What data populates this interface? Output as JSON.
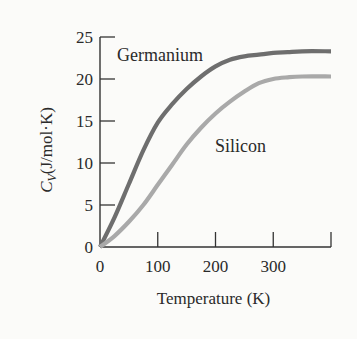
{
  "chart_data": {
    "type": "line",
    "title": "",
    "xlabel": "Temperature (K)",
    "ylabel": "C_V (J/mol·K)",
    "ylabel_main": "C",
    "ylabel_sub": "V",
    "ylabel_rest": "(J/mol·K)",
    "xlim": [
      0,
      400
    ],
    "ylim": [
      0,
      25
    ],
    "xticks": [
      0,
      100,
      200,
      300,
      400
    ],
    "xtick_labels": [
      "0",
      "100",
      "200",
      "300",
      ""
    ],
    "yticks": [
      0,
      5,
      10,
      15,
      20,
      25
    ],
    "ytick_labels": [
      "0",
      "5",
      "10",
      "15",
      "20",
      "25"
    ],
    "grid": false,
    "legend": "inline labels",
    "series": [
      {
        "name": "Germanium",
        "color": "#6e6e6e",
        "x": [
          0,
          25,
          50,
          75,
          100,
          125,
          150,
          175,
          200,
          225,
          250,
          275,
          300,
          325,
          350,
          400
        ],
        "values": [
          0,
          3.5,
          7.5,
          11.5,
          14.8,
          17.0,
          18.8,
          20.3,
          21.5,
          22.3,
          22.7,
          22.9,
          23.1,
          23.2,
          23.3,
          23.3
        ]
      },
      {
        "name": "Silicon",
        "color": "#a9a9a9",
        "x": [
          0,
          25,
          50,
          75,
          100,
          125,
          150,
          175,
          200,
          225,
          250,
          275,
          300,
          325,
          350,
          400
        ],
        "values": [
          0,
          1.3,
          3.0,
          5.0,
          7.4,
          9.8,
          12.2,
          14.2,
          15.9,
          17.3,
          18.5,
          19.5,
          20.0,
          20.2,
          20.3,
          20.3
        ]
      }
    ],
    "annotations": [
      {
        "text": "Germanium",
        "x": 140,
        "y": 22.5
      },
      {
        "text": "Silicon",
        "x": 260,
        "y": 11.5
      }
    ]
  }
}
